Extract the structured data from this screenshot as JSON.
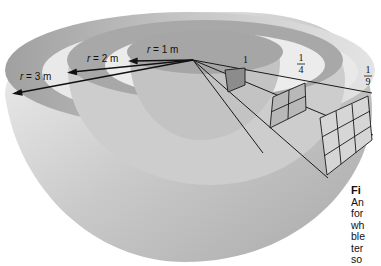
{
  "figure": {
    "type": "inverse-square-law-diagram",
    "radius_labels": [
      {
        "var": "r",
        "eq": " = 1 m"
      },
      {
        "var": "r",
        "eq": " = 2 m"
      },
      {
        "var": "r",
        "eq": " = 3 m"
      }
    ],
    "intensity_labels": [
      {
        "text": "1"
      },
      {
        "num": "1",
        "den": "4"
      },
      {
        "num": "1",
        "den": "9"
      }
    ],
    "grid_sizes": [
      "1x1",
      "2x2",
      "3x3"
    ],
    "colors": {
      "shell_dark": "#9a9a9a",
      "shell_mid": "#c4c4c4",
      "shell_light": "#e6e6e6",
      "rays": "#1a1a1a"
    }
  },
  "caption": {
    "title_fragment": "Fi",
    "lines": [
      "An",
      "for",
      "wh",
      "ble",
      "ter",
      "so"
    ]
  }
}
